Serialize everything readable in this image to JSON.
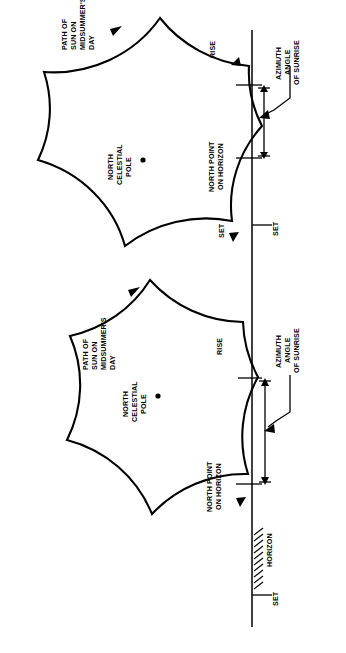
{
  "figure": {
    "orientation": "rotated-90",
    "background_color": "#ffffff",
    "line_color": "#000000"
  },
  "diagrams": [
    {
      "id": "upper-diagram",
      "labels": {
        "path_label": "PATH OF\nSUN ON\nMIDSUMMER'S\nDAY",
        "path_label_lines": [
          "PATH OF",
          "SUN ON",
          "MIDSUMMER'S",
          "DAY"
        ],
        "pole_label_lines": [
          "NORTH",
          "CELESTIAL",
          "POLE"
        ],
        "north_point_lines": [
          "NORTH POINT",
          "ON HORIZON"
        ],
        "azimuth_lines": [
          "AZIMUTH",
          "ANGLE",
          "OF SUNRISE"
        ],
        "rise": "RISE",
        "set_on_curve": "SET",
        "set_on_horizon": "SET"
      }
    },
    {
      "id": "lower-diagram",
      "labels": {
        "path_label_lines": [
          "PATH OF",
          "SUN ON",
          "MIDSUMMER'S",
          "DAY"
        ],
        "pole_label_lines": [
          "NORTH",
          "CELESTIAL",
          "POLE"
        ],
        "north_point_lines": [
          "NORTH POINT",
          "ON HORIZON"
        ],
        "azimuth_lines": [
          "AZIMUTH",
          "ANGLE",
          "OF SUNRISE"
        ],
        "rise": "RISE",
        "horizon": "HORIZON",
        "set": "SET"
      }
    }
  ],
  "text": {
    "path_of": "PATH OF",
    "sun_on": "SUN ON",
    "midsummers": "MIDSUMMER'S",
    "day": "DAY",
    "north": "NORTH",
    "celestial": "CELESTIAL",
    "pole": "POLE",
    "north_point": "NORTH POINT",
    "on_horizon": "ON HORIZON",
    "azimuth": "AZIMUTH",
    "angle": "ANGLE",
    "of_sunrise": "OF SUNRISE",
    "rise": "RISE",
    "set": "SET",
    "horizon": "HORIZON"
  }
}
